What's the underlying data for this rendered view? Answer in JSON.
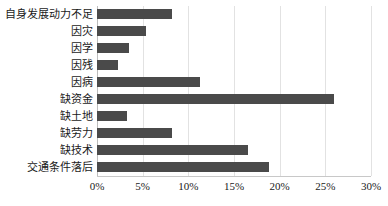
{
  "chart_data": {
    "type": "bar",
    "orientation": "horizontal",
    "title": "",
    "xlabel": "",
    "ylabel": "",
    "categories": [
      "自身发展动力不足",
      "因灾",
      "因学",
      "因残",
      "因病",
      "缺资金",
      "缺土地",
      "缺劳力",
      "缺技术",
      "交通条件落后"
    ],
    "values": [
      8.2,
      5.4,
      3.5,
      2.3,
      11.3,
      26.0,
      3.3,
      8.2,
      16.5,
      18.8
    ],
    "xlim": [
      0,
      30
    ],
    "xticks": [
      0,
      5,
      10,
      15,
      20,
      25,
      30
    ],
    "xtick_labels": [
      "0%",
      "5%",
      "10%",
      "15%",
      "20%",
      "25%",
      "30%"
    ],
    "grid": true,
    "legend": false,
    "bar_color": "#4a4a4a",
    "gridline_color": "#e2e2e2",
    "background_color": "#ffffff"
  }
}
